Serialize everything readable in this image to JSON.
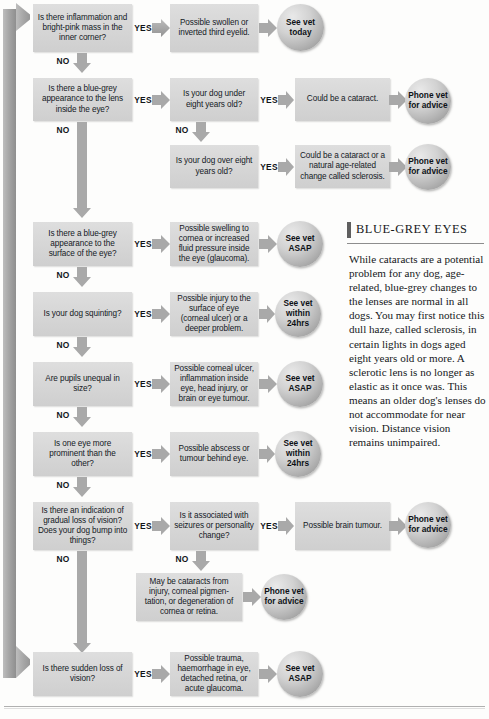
{
  "doc": {
    "labels": {
      "yes": "YES",
      "no": "NO"
    }
  },
  "sidebar_article": {
    "title": "BLUE-GREY EYES",
    "body": "While cataracts are a potential problem for any dog, age-related, blue-grey changes to the lenses are normal in all dogs. You may first notice this dull haze, called sclerosis, in certain lights in dogs aged eight years old or more. A sclerotic lens is no longer as elastic as it once was. This means an older dog's lenses do not accommodate for near vision. Distance vision remains unimpaired."
  },
  "flow": {
    "questions": [
      {
        "id": "q1",
        "text": "Is there inflammation and bright-pink mass in the inner corner?"
      },
      {
        "id": "q2",
        "text": "Is there a blue-grey appearance to the lens inside the eye?"
      },
      {
        "id": "q2a",
        "text": "Is your dog under eight years old?"
      },
      {
        "id": "q2b",
        "text": "Is your dog over eight years old?"
      },
      {
        "id": "q3",
        "text": "Is there a blue-grey appearance to the surface of the eye?"
      },
      {
        "id": "q4",
        "text": "Is your dog squinting?"
      },
      {
        "id": "q5",
        "text": "Are pupils unequal in size?"
      },
      {
        "id": "q6",
        "text": "Is one eye more prominent than the other?"
      },
      {
        "id": "q7",
        "text": "Is there an indication of gradual loss of vision? Does your dog bump into things?"
      },
      {
        "id": "q7a",
        "text": "Is it associated with seizures or personality change?"
      },
      {
        "id": "q8",
        "text": "Is there sudden loss of vision?"
      }
    ],
    "results": [
      {
        "id": "r1",
        "text": "Possible swollen or inverted third eyelid."
      },
      {
        "id": "r2",
        "text": "Could be a cataract."
      },
      {
        "id": "r3",
        "text": "Could be a cataract or a natural age-related change called sclerosis."
      },
      {
        "id": "r4",
        "text": "Possible swelling to cornea or increased fluid pressure inside the eye (glaucoma)."
      },
      {
        "id": "r5",
        "text": "Possible injury to the surface of eye (corneal ulcer) or a deeper problem."
      },
      {
        "id": "r6",
        "text": "Possible corneal ulcer, inflammation inside eye, head injury, or brain or eye tumour."
      },
      {
        "id": "r7",
        "text": "Possible abscess or tumour behind eye."
      },
      {
        "id": "r8",
        "text": "Possible brain tumour."
      },
      {
        "id": "r9",
        "text": "May be cataracts from injury, corneal pigmen-tation, or degeneration of cornea or retina."
      },
      {
        "id": "r10",
        "text": "Possible trauma, haemorrhage in eye, detached retina, or acute glaucoma."
      }
    ],
    "actions": [
      {
        "id": "a1",
        "text": "See vet today"
      },
      {
        "id": "a2",
        "text": "Phone vet for advice"
      },
      {
        "id": "a3",
        "text": "Phone vet for advice"
      },
      {
        "id": "a4",
        "text": "See vet ASAP"
      },
      {
        "id": "a5",
        "text": "See vet within 24hrs"
      },
      {
        "id": "a6",
        "text": "See vet ASAP"
      },
      {
        "id": "a7",
        "text": "See vet within 24hrs"
      },
      {
        "id": "a8",
        "text": "Phone vet for advice"
      },
      {
        "id": "a9",
        "text": "Phone vet for advice"
      },
      {
        "id": "a10",
        "text": "See vet ASAP"
      }
    ]
  },
  "colors": {
    "box_fill": "#d7d7d7",
    "circle_fill": "#c2c2c2",
    "arrow_fill": "#a6a6a6",
    "spine_fill": "#a8a8a8",
    "text": "#14191f"
  }
}
